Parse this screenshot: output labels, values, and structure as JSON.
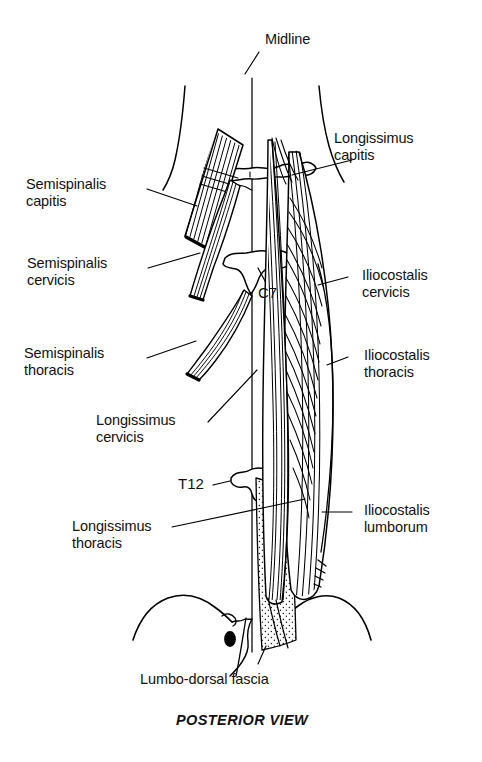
{
  "figure": {
    "caption": "POSTERIOR VIEW",
    "background_color": "#ffffff",
    "ink_color": "#000000",
    "subject": "Erector spinae and transversospinalis muscles of the back"
  },
  "annotations": {
    "midline": {
      "label": "Midline"
    },
    "vertebra_c7": {
      "label": "C7"
    },
    "vertebra_t12": {
      "label": "T12"
    }
  },
  "labels_left": [
    {
      "name": "semispinalis-capitis",
      "line1": "Semispinalis",
      "line2": "capitis"
    },
    {
      "name": "semispinalis-cervicis",
      "line1": "Semispinalis",
      "line2": "cervicis"
    },
    {
      "name": "semispinalis-thoracis",
      "line1": "Semispinalis",
      "line2": "thoracis"
    },
    {
      "name": "longissimus-cervicis",
      "line1": "Longissimus",
      "line2": "cervicis"
    },
    {
      "name": "longissimus-thoracis",
      "line1": "Longissimus",
      "line2": "thoracis"
    }
  ],
  "labels_right": [
    {
      "name": "longissimus-capitis",
      "line1": "Longissimus",
      "line2": "capitis"
    },
    {
      "name": "iliocostalis-cervicis",
      "line1": "Iliocostalis",
      "line2": "cervicis"
    },
    {
      "name": "iliocostalis-thoracis",
      "line1": "Iliocostalis",
      "line2": "thoracis"
    },
    {
      "name": "iliocostalis-lumborum",
      "line1": "Iliocostalis",
      "line2": "lumborum"
    }
  ],
  "labels_bottom": [
    {
      "name": "lumbo-dorsal-fascia",
      "line1": "Lumbo-dorsal fascia"
    }
  ]
}
